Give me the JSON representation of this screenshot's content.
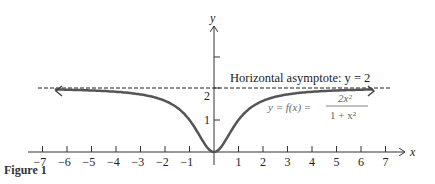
{
  "chart_data": {
    "type": "line",
    "title": "",
    "caption": "Figure 1",
    "xlabel": "x",
    "ylabel": "y",
    "xlim": [
      -7.5,
      7.5
    ],
    "ylim": [
      0,
      3
    ],
    "x_ticks": [
      -7,
      -6,
      -5,
      -4,
      -3,
      -2,
      -1,
      1,
      2,
      3,
      4,
      5,
      6,
      7
    ],
    "y_ticks": [
      1,
      2,
      3
    ],
    "y_tick_labels": [
      "1",
      "2",
      ""
    ],
    "grid": false,
    "series": [
      {
        "name": "y = f(x) = 2x^2 / (1 + x^2)",
        "function": "2*x^2/(1+x^2)",
        "x_range": [
          -6.5,
          6.5
        ],
        "color": "#555555"
      }
    ],
    "asymptote": {
      "type": "horizontal",
      "y": 2,
      "style": "dashed"
    },
    "annotations": [
      {
        "text": "Horizontal asymptote: y = 2"
      },
      {
        "text": "y = f(x) = 2x² / (1 + x²)"
      }
    ]
  },
  "labels": {
    "x_axis": "x",
    "y_axis": "y",
    "asymptote": "Horizontal asymptote: y = 2",
    "eq_lhs": "y = f(x) =",
    "eq_num": "2x²",
    "eq_den": "1 + x²",
    "figure": "Figure 1",
    "xticks": [
      "−7",
      "−6",
      "−5",
      "−4",
      "−3",
      "−2",
      "−1",
      "1",
      "2",
      "3",
      "4",
      "5",
      "6",
      "7"
    ],
    "y1": "1",
    "y2": "2"
  },
  "colors": {
    "curve": "#555555",
    "axis": "#333333"
  }
}
